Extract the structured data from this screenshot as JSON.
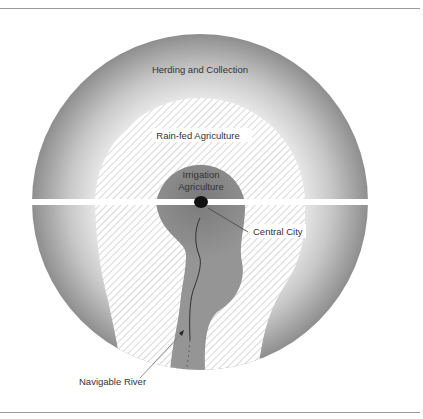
{
  "diagram": {
    "type": "concentric-land-use-model",
    "zones": [
      {
        "id": "herding",
        "label": "Herding and Collection",
        "fill": "gradient-gray"
      },
      {
        "id": "rainfed",
        "label": "Rain-fed Agriculture",
        "fill": "hatched"
      },
      {
        "id": "irrigation",
        "label_line1": "Irrigation",
        "label_line2": "Agriculture",
        "fill": "#8c8c8c"
      }
    ],
    "callouts": {
      "central_city": "Central City",
      "navigable_river": "Navigable River"
    },
    "colors": {
      "outer_dark": "#8f8f8f",
      "outer_light": "#f2f2f2",
      "irrigation": "#8a8a8a",
      "city": "#111111",
      "hatch": "#b5b5b5",
      "rule": "#9a9a9a"
    }
  }
}
